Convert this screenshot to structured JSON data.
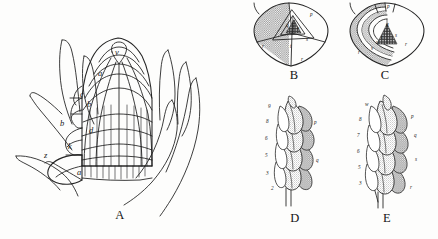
{
  "plate": {
    "title": "Comparative plate of shoot apex and leaf arrangement",
    "background_color": "#fdfdfc",
    "ink_color": "#1b1b1b",
    "shade_color": "#9a9a9a"
  },
  "figures": [
    {
      "id": "A",
      "caption": "A",
      "description": "Longitudinal section of a shoot apex showing cell rows, leaf primordia and subtending bracts",
      "labels": [
        {
          "text": "v",
          "x": 118,
          "y": 55
        },
        {
          "text": "a",
          "x": 101,
          "y": 76
        },
        {
          "text": "c",
          "x": 83,
          "y": 97
        },
        {
          "text": "b",
          "x": 89,
          "y": 105
        },
        {
          "text": "b",
          "x": 62,
          "y": 124
        },
        {
          "text": "d",
          "x": 91,
          "y": 131
        },
        {
          "text": "k",
          "x": 70,
          "y": 146
        },
        {
          "text": "z",
          "x": 46,
          "y": 155
        },
        {
          "text": "a",
          "x": 79,
          "y": 172
        }
      ]
    },
    {
      "id": "B",
      "caption": "B",
      "description": "Transverse diagram of the apex: shield outline with one large shaded sector and nested triangular younger primordia",
      "labels": [
        {
          "text": "r",
          "x": 18,
          "y": 48
        },
        {
          "text": "p",
          "x": 66,
          "y": 15
        },
        {
          "text": "q",
          "x": 42,
          "y": 26
        },
        {
          "text": "s",
          "x": 62,
          "y": 40
        },
        {
          "text": "t",
          "x": 46,
          "y": 48
        },
        {
          "text": "u",
          "x": 53,
          "y": 29
        },
        {
          "text": "v",
          "x": 55,
          "y": 34
        },
        {
          "text": "r",
          "x": 58,
          "y": 63
        }
      ]
    },
    {
      "id": "C",
      "caption": "C",
      "description": "Transverse diagram with successive concentric shaded leaf sheaths surrounding a dark central cone",
      "labels": [
        {
          "text": "p",
          "x": 52,
          "y": 8
        },
        {
          "text": "q",
          "x": 51,
          "y": 25
        },
        {
          "text": "s",
          "x": 60,
          "y": 36
        },
        {
          "text": "t",
          "x": 46,
          "y": 38
        },
        {
          "text": "u",
          "x": 41,
          "y": 43
        },
        {
          "text": "r",
          "x": 70,
          "y": 45
        },
        {
          "text": "v",
          "x": 36,
          "y": 49
        },
        {
          "text": "r",
          "x": 22,
          "y": 53
        }
      ]
    },
    {
      "id": "D",
      "caption": "D",
      "description": "Side view of a spirally arranged series of five overlapping leaf primordia on the axis",
      "labels_left": [
        {
          "text": "9",
          "x": 11,
          "y": 16
        },
        {
          "text": "8",
          "x": 8,
          "y": 31
        },
        {
          "text": "6",
          "x": 7,
          "y": 47
        },
        {
          "text": "5",
          "x": 8,
          "y": 64
        },
        {
          "text": "3",
          "x": 9,
          "y": 82
        },
        {
          "text": "2",
          "x": 14,
          "y": 99
        }
      ],
      "labels_right": [
        {
          "text": "p",
          "x": 58,
          "y": 33
        },
        {
          "text": "q",
          "x": 60,
          "y": 70
        }
      ]
    },
    {
      "id": "E",
      "caption": "E",
      "description": "Side view of a denser spiral of leaf primordia, older and more numerous than in D",
      "labels_left": [
        {
          "text": "w",
          "x": 16,
          "y": 14
        },
        {
          "text": "8",
          "x": 10,
          "y": 29
        },
        {
          "text": "7",
          "x": 8,
          "y": 44
        },
        {
          "text": "6",
          "x": 8,
          "y": 60
        },
        {
          "text": "5",
          "x": 9,
          "y": 76
        },
        {
          "text": "3",
          "x": 10,
          "y": 92
        }
      ],
      "labels_right": [
        {
          "text": "p",
          "x": 63,
          "y": 26
        },
        {
          "text": "q",
          "x": 66,
          "y": 45
        },
        {
          "text": "s",
          "x": 67,
          "y": 69
        },
        {
          "text": "r",
          "x": 62,
          "y": 97
        }
      ]
    }
  ]
}
